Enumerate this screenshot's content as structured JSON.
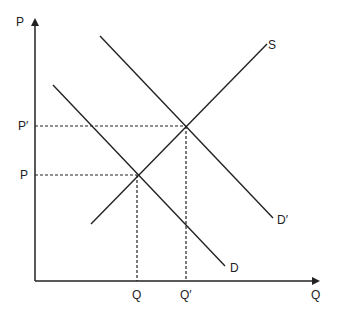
{
  "diagram": {
    "type": "supply-demand",
    "axes": {
      "y_label": "P",
      "x_label": "Q"
    },
    "curves": [
      {
        "name": "S",
        "label": "S",
        "kind": "supply"
      },
      {
        "name": "D",
        "label": "D",
        "kind": "demand"
      },
      {
        "name": "D'",
        "label": "D′",
        "kind": "demand-shifted"
      }
    ],
    "price_levels": [
      {
        "label": "P",
        "meaning": "initial equilibrium price"
      },
      {
        "label": "P′",
        "meaning": "new equilibrium price"
      }
    ],
    "quantity_levels": [
      {
        "label": "Q",
        "meaning": "initial equilibrium quantity"
      },
      {
        "label": "Q′",
        "meaning": "new equilibrium quantity"
      }
    ],
    "colors": {
      "line": "#222222",
      "background": "#ffffff"
    }
  }
}
